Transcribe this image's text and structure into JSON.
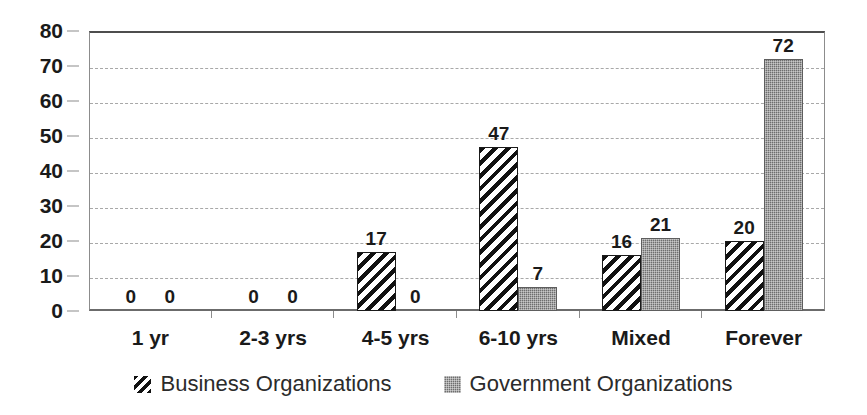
{
  "chart_data": {
    "type": "bar",
    "title": "",
    "subtitle": "",
    "xlabel": "",
    "ylabel": "",
    "ylim": [
      0,
      80
    ],
    "ytick_step": 10,
    "yticks": [
      80,
      70,
      60,
      50,
      40,
      30,
      20,
      10,
      0
    ],
    "grid": true,
    "grid_style": "dashed-horizontal",
    "legend_position": "bottom-center",
    "categories": [
      "1 yr",
      "2-3 yrs",
      "4-5 yrs",
      "6-10 yrs",
      "Mixed",
      "Forever"
    ],
    "series": [
      {
        "name": "Business Organizations",
        "pattern": "diagonal-hatch",
        "color": "#111111",
        "values": [
          0,
          0,
          17,
          47,
          16,
          20
        ],
        "labels": [
          "0",
          "0",
          "17",
          "47",
          "16",
          "20"
        ]
      },
      {
        "name": "Government Organizations",
        "pattern": "dotted-fill",
        "color": "#6e6e6e",
        "values": [
          0,
          0,
          0,
          7,
          21,
          72
        ],
        "labels": [
          "0",
          "0",
          "0",
          "7",
          "21",
          "72"
        ]
      }
    ]
  },
  "legend": {
    "items": [
      {
        "label": "Business Organizations",
        "swatch": "hatch-swatch-icon"
      },
      {
        "label": "Government Organizations",
        "swatch": "dotted-swatch-icon"
      }
    ]
  },
  "axis": {
    "y_labels": [
      "80",
      "70",
      "60",
      "50",
      "40",
      "30",
      "20",
      "10",
      "0"
    ],
    "x_labels": [
      "1 yr",
      "2-3 yrs",
      "4-5 yrs",
      "6-10 yrs",
      "Mixed",
      "Forever"
    ]
  }
}
